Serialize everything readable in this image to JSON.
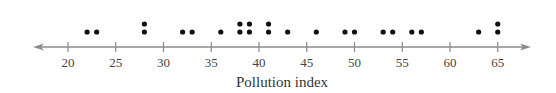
{
  "chart_data": {
    "type": "dot",
    "title": "",
    "xlabel": "Pollution index",
    "ylabel": "",
    "xlim": [
      17,
      68
    ],
    "ticks": [
      20,
      25,
      30,
      35,
      40,
      45,
      50,
      55,
      60,
      65
    ],
    "tick_labels": [
      "20",
      "25",
      "30",
      "35",
      "40",
      "45",
      "50",
      "55",
      "60",
      "65"
    ],
    "axis_arrows": "both",
    "grid": false,
    "points": [
      {
        "x": 22,
        "count": 1
      },
      {
        "x": 23,
        "count": 1
      },
      {
        "x": 28,
        "count": 2
      },
      {
        "x": 32,
        "count": 1
      },
      {
        "x": 33,
        "count": 1
      },
      {
        "x": 36,
        "count": 1
      },
      {
        "x": 38,
        "count": 2
      },
      {
        "x": 39,
        "count": 2
      },
      {
        "x": 41,
        "count": 2
      },
      {
        "x": 43,
        "count": 1
      },
      {
        "x": 46,
        "count": 1
      },
      {
        "x": 49,
        "count": 1
      },
      {
        "x": 50,
        "count": 1
      },
      {
        "x": 53,
        "count": 1
      },
      {
        "x": 54,
        "count": 1
      },
      {
        "x": 56,
        "count": 1
      },
      {
        "x": 57,
        "count": 1
      },
      {
        "x": 63,
        "count": 1
      },
      {
        "x": 65,
        "count": 2
      }
    ],
    "values": [
      22,
      23,
      28,
      28,
      32,
      33,
      36,
      38,
      38,
      39,
      39,
      41,
      41,
      43,
      46,
      49,
      50,
      53,
      54,
      56,
      57,
      63,
      65,
      65
    ],
    "colors": {
      "dots": "#111111",
      "axis": "#888888",
      "text": "#444444"
    }
  }
}
